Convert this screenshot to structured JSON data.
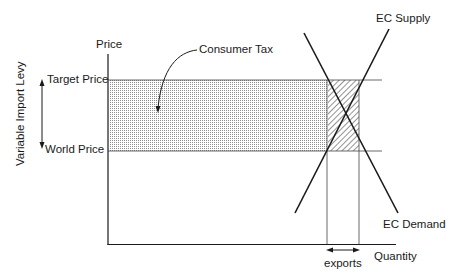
{
  "diagram": {
    "type": "economics supply-demand diagram",
    "axes": {
      "y_label": "Price",
      "x_label": "Quantity"
    },
    "price_levels": {
      "target_price": "Target Price",
      "world_price": "World Price"
    },
    "levy_label": "Variable Import Levy",
    "annotations": {
      "consumer_tax": "Consumer Tax",
      "exports": "exports"
    },
    "curves": {
      "supply": "EC Supply",
      "demand": "EC Demand"
    },
    "colors": {
      "line": "#1a1a1a",
      "dot_fill": "#9a9a9a",
      "hatch": "#2a2a2a",
      "background": "#ffffff"
    }
  }
}
